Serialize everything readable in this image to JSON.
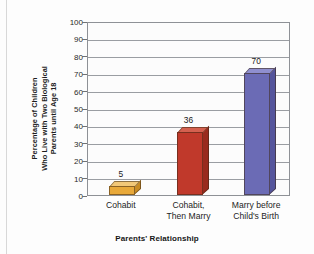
{
  "chart_data": {
    "type": "bar",
    "title": "",
    "xlabel": "Parents' Relationship",
    "ylabel": "Percentage of Children Who Live with Two Biological Parents until Age 18",
    "ylabel_lines": [
      "Percentage of Children",
      "Who Live with Two Biological",
      "Parents until Age 18"
    ],
    "categories": [
      "Cohabit",
      "Cohabit, Then Marry",
      "Marry before Child's Birth"
    ],
    "category_lines": [
      [
        "Cohabit"
      ],
      [
        "Cohabit,",
        "Then Marry"
      ],
      [
        "Marry before",
        "Child's Birth"
      ]
    ],
    "values": [
      5,
      36,
      70
    ],
    "value_labels": [
      "5",
      "36",
      "70"
    ],
    "ylim": [
      0,
      100
    ],
    "ytick_step": 10,
    "yticks": [
      0,
      10,
      20,
      30,
      40,
      50,
      60,
      70,
      80,
      90,
      100
    ],
    "ytick_labels": [
      "0",
      "10",
      "20",
      "30",
      "40",
      "50",
      "60",
      "70",
      "80",
      "90",
      "100"
    ],
    "grid": true,
    "legend": "none",
    "bar_colors": [
      "#e8a93a",
      "#c0392b",
      "#6b6bb5"
    ],
    "bar_top_colors": [
      "#f2c878",
      "#d4604f",
      "#8f8fcf"
    ],
    "bar_side_colors": [
      "#c98c24",
      "#992b1e",
      "#55559c"
    ],
    "plot_background": "#fcfcfc",
    "gridline_color": "#9a9da2",
    "frame_color": "#8e9196"
  }
}
